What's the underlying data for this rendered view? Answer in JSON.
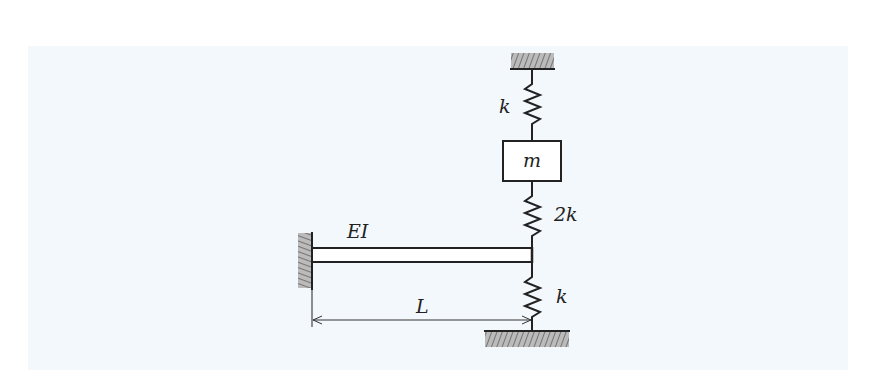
{
  "diagram": {
    "type": "mechanical-vibration-system",
    "background_color": "#f3f8fc",
    "line_color": "#222222",
    "labels": {
      "beam_rigidity": "EI",
      "beam_length": "L",
      "top_spring": "k",
      "mass": "m",
      "middle_spring": "2k",
      "bottom_spring": "k"
    },
    "components": [
      {
        "id": "ceiling-support",
        "kind": "fixed-support",
        "position": "top"
      },
      {
        "id": "top-spring",
        "kind": "spring",
        "label": "k",
        "connects": [
          "ceiling-support",
          "mass"
        ]
      },
      {
        "id": "mass",
        "kind": "mass",
        "label": "m"
      },
      {
        "id": "middle-spring",
        "kind": "spring",
        "label": "2k",
        "connects": [
          "mass",
          "beam-tip"
        ]
      },
      {
        "id": "beam",
        "kind": "cantilever-beam",
        "label": "EI",
        "length_label": "L"
      },
      {
        "id": "wall-support",
        "kind": "fixed-support",
        "position": "left"
      },
      {
        "id": "bottom-spring",
        "kind": "spring",
        "label": "k",
        "connects": [
          "beam-tip",
          "ground-support"
        ]
      },
      {
        "id": "ground-support",
        "kind": "fixed-support",
        "position": "bottom"
      }
    ]
  }
}
